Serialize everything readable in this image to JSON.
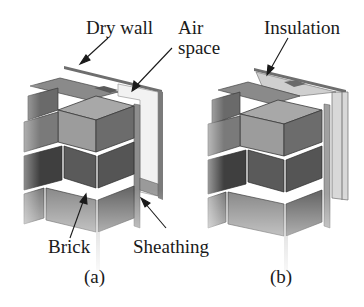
{
  "figure": {
    "panels": [
      {
        "id": "a",
        "caption": "(a)",
        "labels": {
          "dry_wall": "Dry wall",
          "air_line1": "Air",
          "air_line2": "space",
          "brick": "Brick",
          "sheathing": "Sheathing"
        }
      },
      {
        "id": "b",
        "caption": "(b)",
        "labels": {
          "insulation": "Insulation"
        }
      }
    ],
    "colors": {
      "brick_light": "#9a9a9a",
      "brick_mid": "#7a7a7a",
      "brick_dark": "#4a4a4a",
      "mortar": "#b5b5b5",
      "panel": "#e8e8e8",
      "stud": "#6e6e6e",
      "text": "#1a1a1a"
    }
  }
}
